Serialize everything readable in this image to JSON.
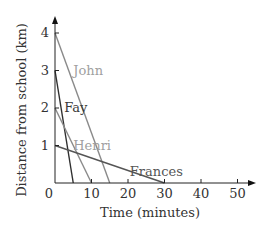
{
  "chart_data": {
    "type": "line",
    "title": "",
    "xlabel": "Time (minutes)",
    "ylabel": "Distance from school (km)",
    "xlim": [
      0,
      55
    ],
    "ylim": [
      0,
      4.3
    ],
    "x_ticks": [
      0,
      10,
      20,
      30,
      40,
      50
    ],
    "y_ticks": [
      1,
      2,
      3,
      4
    ],
    "x_tick_labels": [
      "0",
      "10",
      "20",
      "30",
      "40",
      "50"
    ],
    "y_tick_labels": [
      "1",
      "2",
      "3",
      "4"
    ],
    "origin_label": "0",
    "grid": false,
    "legend": "inline labels",
    "series": [
      {
        "name": "John",
        "x": [
          0,
          15
        ],
        "y": [
          4,
          0
        ],
        "color": "#8a8a8a",
        "label_color": "#a0a0a0",
        "label_pos": [
          5,
          3
        ]
      },
      {
        "name": "Fay",
        "x": [
          0,
          5
        ],
        "y": [
          3,
          0
        ],
        "color": "#2f2f2f",
        "label_color": "#3a3a3a",
        "label_pos": [
          2.5,
          2
        ]
      },
      {
        "name": "Henri",
        "x": [
          0,
          10
        ],
        "y": [
          2,
          0
        ],
        "color": "#8a8a8a",
        "label_color": "#a0a0a0",
        "label_pos": [
          5,
          1
        ]
      },
      {
        "name": "Frances",
        "x": [
          0,
          30
        ],
        "y": [
          1,
          0
        ],
        "color": "#555555",
        "label_color": "#555555",
        "label_pos": [
          20.5,
          0.3
        ]
      }
    ]
  }
}
